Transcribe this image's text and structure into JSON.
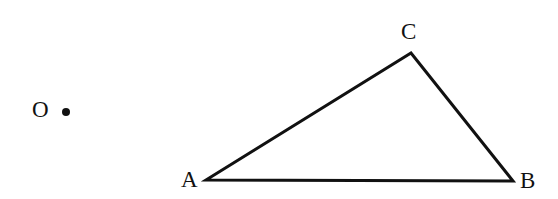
{
  "diagram": {
    "type": "geometry-figure",
    "point_O": {
      "label": "O",
      "x": 66,
      "y": 112
    },
    "triangle": {
      "vertices": [
        {
          "label": "A",
          "x": 206,
          "y": 180
        },
        {
          "label": "C",
          "x": 411,
          "y": 53
        },
        {
          "label": "B",
          "x": 513,
          "y": 181
        }
      ],
      "stroke_color": "#111111"
    }
  }
}
